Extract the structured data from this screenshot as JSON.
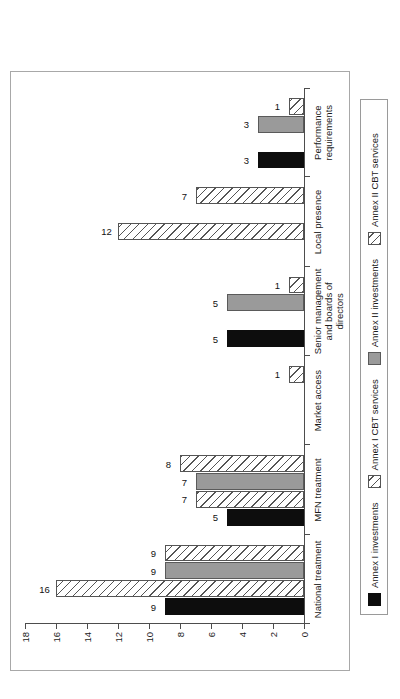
{
  "chart_data": {
    "type": "bar",
    "title": "",
    "subtitle": "",
    "xlabel": "",
    "ylabel": "",
    "ylim": [
      0,
      18
    ],
    "yticks": [
      0,
      2,
      4,
      6,
      8,
      10,
      12,
      14,
      16,
      18
    ],
    "grid": false,
    "legend_position": "bottom",
    "orientation": "vertical-rotated",
    "categories": [
      "National treatment",
      "MFN treatment",
      "Market access",
      "Senior management and boards of directors",
      "Local presence",
      "Performance requirements"
    ],
    "category_lines": [
      [
        "National treatment"
      ],
      [
        "MFN treatment"
      ],
      [
        "Market access"
      ],
      [
        "Senior management",
        "and boards of",
        "directors"
      ],
      [
        "Local presence"
      ],
      [
        "Performance",
        "requirements"
      ]
    ],
    "series": [
      {
        "name": "Annex I investments",
        "style": "solid-black",
        "color": "#0d0d0d",
        "values": [
          9,
          5,
          0,
          5,
          0,
          3
        ],
        "labels": [
          "9",
          "5",
          "",
          "5",
          "",
          "3"
        ]
      },
      {
        "name": "Annex I CBT services",
        "style": "hatched",
        "color": "#ffffff",
        "values": [
          16,
          7,
          0,
          0,
          12,
          0
        ],
        "labels": [
          "16",
          "7",
          "",
          "",
          "12",
          ""
        ]
      },
      {
        "name": "Annex II investments",
        "style": "solid-gray",
        "color": "#9a9a9a",
        "values": [
          9,
          7,
          0,
          5,
          0,
          3
        ],
        "labels": [
          "9",
          "7",
          "",
          "5",
          "",
          "3"
        ]
      },
      {
        "name": "Annex II CBT services",
        "style": "hatched",
        "color": "#ffffff",
        "values": [
          9,
          8,
          1,
          1,
          7,
          1
        ],
        "labels": [
          "9",
          "8",
          "1",
          "1",
          "7",
          "1"
        ]
      }
    ]
  },
  "legend": {
    "items": [
      {
        "label": "Annex I investments",
        "style": "s0"
      },
      {
        "label": "Annex I CBT services",
        "style": "s1"
      },
      {
        "label": "Annex II investments",
        "style": "s2"
      },
      {
        "label": "Annex II CBT services",
        "style": "s3"
      }
    ]
  }
}
